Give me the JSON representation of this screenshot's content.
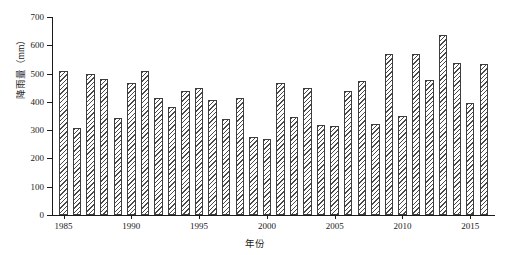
{
  "chart_data": {
    "type": "bar",
    "title": "",
    "xlabel": "年份",
    "ylabel": "降雨量（mm）",
    "ylim": [
      0,
      700
    ],
    "yticks": [
      0,
      100,
      200,
      300,
      400,
      500,
      600,
      700
    ],
    "xticks": [
      1985,
      1990,
      1995,
      2000,
      2005,
      2010,
      2015
    ],
    "grid": false,
    "legend": null,
    "bar_style": "diagonal-hatch",
    "categories": [
      1985,
      1986,
      1987,
      1988,
      1989,
      1990,
      1991,
      1992,
      1993,
      1994,
      1995,
      1996,
      1997,
      1998,
      1999,
      2000,
      2001,
      2002,
      2003,
      2004,
      2005,
      2006,
      2007,
      2008,
      2009,
      2010,
      2011,
      2012,
      2013,
      2014,
      2015,
      2016
    ],
    "values": [
      510,
      308,
      500,
      480,
      342,
      465,
      510,
      415,
      383,
      440,
      450,
      408,
      338,
      412,
      275,
      268,
      465,
      345,
      448,
      318,
      315,
      440,
      475,
      322,
      570,
      350,
      570,
      478,
      638,
      538,
      395,
      535
    ],
    "series": [
      {
        "name": "降雨量",
        "unit": "mm",
        "values": [
          510,
          308,
          500,
          480,
          342,
          465,
          510,
          415,
          383,
          440,
          450,
          408,
          338,
          412,
          275,
          268,
          465,
          345,
          448,
          318,
          315,
          440,
          475,
          322,
          570,
          350,
          570,
          478,
          638,
          538,
          395,
          535
        ]
      }
    ]
  },
  "axis": {
    "y_tick_labels": [
      "0",
      "100",
      "200",
      "300",
      "400",
      "500",
      "600",
      "700"
    ],
    "x_tick_labels": [
      "1985",
      "1990",
      "1995",
      "2000",
      "2005",
      "2010",
      "2015"
    ]
  }
}
